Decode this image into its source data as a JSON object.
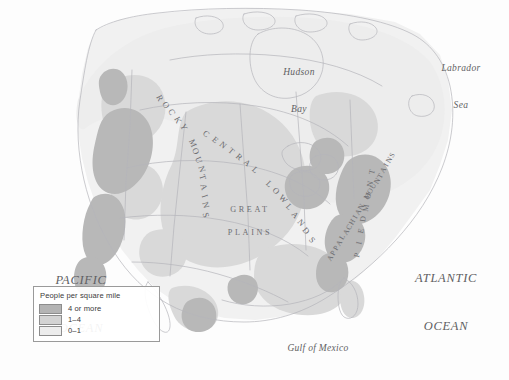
{
  "map": {
    "title": "Population density of North America",
    "background_color": "#fdfdfd",
    "coastline_color": "#b9b9bd",
    "border_color": "#c3c3c7",
    "label_color": "#6c6c70"
  },
  "legend": {
    "title": "People per square mile",
    "box_border_color": "#9a9a9a",
    "entries": [
      {
        "label": "4 or more",
        "color": "#b4b4b4"
      },
      {
        "label": "1–4",
        "color": "#d3d3d3"
      },
      {
        "label": "0–1",
        "color": "#ededed"
      }
    ]
  },
  "water_labels": [
    {
      "name": "pacific-ocean",
      "line1": "PACIFIC",
      "line2": "OCEAN",
      "x": 38,
      "y": 240,
      "size": "ocean"
    },
    {
      "name": "atlantic-ocean",
      "line1": "ATLANTIC",
      "line2": "OCEAN",
      "x": 404,
      "y": 238,
      "size": "ocean"
    },
    {
      "name": "hudson-bay",
      "line1": "Hudson",
      "line2": "Bay",
      "x": 277,
      "y": 42,
      "size": "sea"
    },
    {
      "name": "labrador-sea",
      "line1": "Labrador",
      "line2": "Sea",
      "x": 437,
      "y": 38,
      "size": "sea"
    },
    {
      "name": "gulf-of-mexico",
      "line1": "Gulf of Mexico",
      "line2": "",
      "x": 271,
      "y": 320,
      "size": "gulf"
    }
  ],
  "physiographic_labels": [
    {
      "name": "rocky-mountains",
      "text": "ROCKY MOUNTAINS"
    },
    {
      "name": "central-lowlands",
      "text": "CENTRAL LOWLANDS"
    },
    {
      "name": "great-plains-line1",
      "text": "GREAT"
    },
    {
      "name": "great-plains-line2",
      "text": "PLAINS"
    },
    {
      "name": "appalachian-mountains",
      "text": "APPALACHIAN MOUNTAINS"
    },
    {
      "name": "piedmont",
      "text": "PIEDMONT"
    }
  ],
  "chart_data": {
    "type": "map",
    "legend_title": "People per square mile",
    "classes": [
      {
        "label": "4 or more",
        "color": "#b4b4b4",
        "min": 4,
        "max": null
      },
      {
        "label": "1–4",
        "color": "#d3d3d3",
        "min": 1,
        "max": 4
      },
      {
        "label": "0–1",
        "color": "#ededed",
        "min": 0,
        "max": 1
      }
    ],
    "regions_labeled": [
      "ROCKY MOUNTAINS",
      "CENTRAL LOWLANDS",
      "GREAT PLAINS",
      "APPALACHIAN MOUNTAINS",
      "PIEDMONT"
    ],
    "water_bodies_labeled": [
      "PACIFIC OCEAN",
      "ATLANTIC OCEAN",
      "Hudson Bay",
      "Labrador Sea",
      "Gulf of Mexico"
    ]
  }
}
